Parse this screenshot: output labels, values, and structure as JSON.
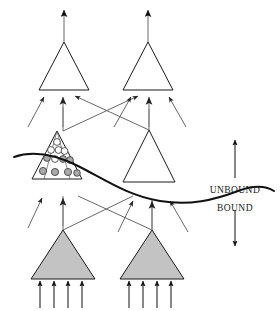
{
  "figure": {
    "background_color": "#ffffff",
    "stroke_color": "#1a1a1a",
    "thin_stroke_color": "#555555",
    "shaded_fill": "#c3c3c3",
    "vesicle_open_fill": "#ffffff",
    "vesicle_shaded_fill": "#a9a9a9",
    "width": 280,
    "height": 311
  },
  "labels": {
    "unbound": "UNBOUND",
    "bound": "BOUND"
  },
  "layers": [
    {
      "name": "top-layer",
      "row": "output",
      "filled": false,
      "units": [
        {
          "id": "top-left-neuron",
          "cx": 64,
          "cy": 90,
          "half_width": 25,
          "height": 48
        },
        {
          "id": "top-right-neuron",
          "cx": 148,
          "cy": 90,
          "half_width": 25,
          "height": 48
        }
      ],
      "output_arrows": 1,
      "input_arrows": 3
    },
    {
      "name": "middle-layer",
      "row": "hidden",
      "filled": false,
      "units": [
        {
          "id": "middle-left-neuron",
          "cx": 57,
          "cy": 179,
          "half_width": 25,
          "height": 48,
          "has_vesicles": true
        },
        {
          "id": "middle-right-neuron",
          "cx": 149,
          "cy": 182,
          "half_width": 26,
          "height": 52,
          "has_vesicles": false
        }
      ],
      "output_arrows": 1,
      "input_arrows": 3
    },
    {
      "name": "bottom-layer",
      "row": "input",
      "filled": true,
      "units": [
        {
          "id": "bottom-left-neuron",
          "cx": 63,
          "cy": 279,
          "half_width": 32,
          "height": 49
        },
        {
          "id": "bottom-right-neuron",
          "cx": 152,
          "cy": 279,
          "half_width": 32,
          "height": 49
        }
      ],
      "output_arrows": 0,
      "input_arrows": 4
    }
  ],
  "vesicles": {
    "open_count": 6,
    "shaded_count": 6,
    "radius": 3.4,
    "description": "clustered circles inside middle-left neuron"
  },
  "boundary_curve": {
    "name": "bound-unbound-wavy-line",
    "stroke_width": 2,
    "description": "wavy line crossing the figure separating BOUND (below) from UNBOUND (above)"
  },
  "scale_arrow": {
    "name": "unbound-bound-double-arrow",
    "x": 235,
    "top_y": 138,
    "bottom_y": 248,
    "double_headed": true
  }
}
